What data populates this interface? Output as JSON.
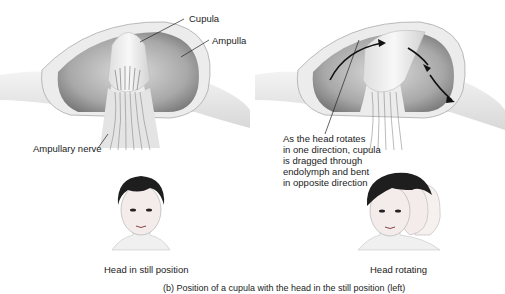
{
  "labels": {
    "cupula": "Cupula",
    "ampulla": "Ampulla",
    "ampullary_nerve": "Ampullary nerve",
    "rotation_note": "As the head rotates\nin one direction, cupula\nis dragged through\nendolymph and bent\nin opposite direction",
    "head_still": "Head in still position",
    "head_rotating": "Head rotating"
  },
  "caption": "(b) Position of a cupula with the head in the still position (left)",
  "colors": {
    "cavity_dark": "#8a8a8a",
    "cavity_light": "#d8d8d8",
    "tissue": "#e8e8e8",
    "outline": "#9a9a9a",
    "hair": "#1e1e1e",
    "arrow": "#111111"
  }
}
